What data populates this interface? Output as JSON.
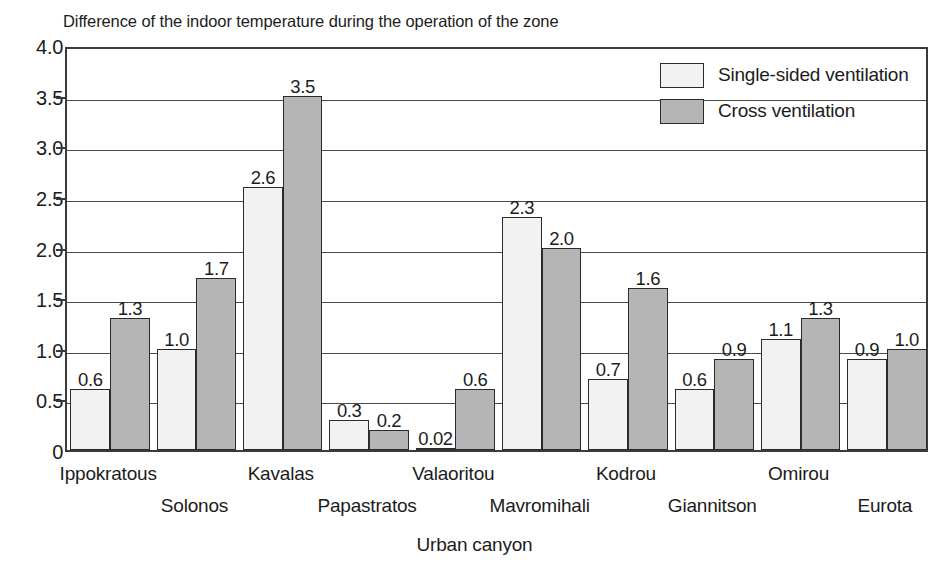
{
  "chart_data": {
    "type": "bar",
    "title": "Difference of the indoor temperature during the operation of the zone",
    "xlabel": "Urban canyon",
    "ylabel": "",
    "ylim": [
      0,
      4.0
    ],
    "yticks": [
      "0",
      "0.5",
      "1.0",
      "1.5",
      "2.0",
      "2.5",
      "3.0",
      "3.5",
      "4.0"
    ],
    "ytick_values": [
      0,
      0.5,
      1.0,
      1.5,
      2.0,
      2.5,
      3.0,
      3.5,
      4.0
    ],
    "grid": true,
    "legend_position": "top-right",
    "categories": [
      "Ippokratous",
      "Solonos",
      "Kavalas",
      "Papastratos",
      "Valaoritou",
      "Mavromihali",
      "Kodrou",
      "Giannitson",
      "Omirou",
      "Eurota"
    ],
    "series": [
      {
        "name": "Single-sided ventilation",
        "color": "#f2f2f2",
        "values": [
          0.6,
          1.0,
          2.6,
          0.3,
          0.02,
          2.3,
          0.7,
          0.6,
          1.1,
          0.9
        ],
        "labels": [
          "0.6",
          "1.0",
          "2.6",
          "0.3",
          "0.02",
          "2.3",
          "0.7",
          "0.6",
          "1.1",
          "0.9"
        ]
      },
      {
        "name": "Cross ventilation",
        "color": "#b5b5b5",
        "values": [
          1.3,
          1.7,
          3.5,
          0.2,
          0.6,
          2.0,
          1.6,
          0.9,
          1.3,
          1.0
        ],
        "labels": [
          "1.3",
          "1.7",
          "3.5",
          "0.2",
          "0.6",
          "2.0",
          "1.6",
          "0.9",
          "1.3",
          "1.0"
        ]
      }
    ]
  },
  "legend": {
    "entries": [
      {
        "label": "Single-sided ventilation",
        "swatch": "single"
      },
      {
        "label": "Cross ventilation",
        "swatch": "cross"
      }
    ]
  },
  "colors": {
    "single_sided": "#f2f2f2",
    "cross": "#b5b5b5",
    "axis": "#3a3a3a",
    "text": "#1c1c1c"
  }
}
